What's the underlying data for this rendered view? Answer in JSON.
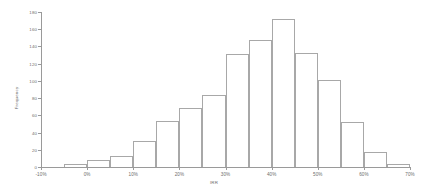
{
  "chart_data": {
    "type": "bar",
    "title": "",
    "xlabel": "IRR",
    "ylabel": "Frequency",
    "xlim": [
      -10,
      70
    ],
    "ylim": [
      0,
      180
    ],
    "grid": false,
    "legend": null,
    "bin_width": 5,
    "x_tick_labels": [
      "-10%",
      "0%",
      "10%",
      "20%",
      "30%",
      "40%",
      "50%",
      "60%",
      "70%"
    ],
    "x_tick_values": [
      -10,
      0,
      10,
      20,
      30,
      40,
      50,
      60,
      70
    ],
    "y_tick_labels": [
      "0",
      "20",
      "40",
      "60",
      "80",
      "100",
      "120",
      "140",
      "160",
      "180"
    ],
    "y_tick_values": [
      0,
      20,
      40,
      60,
      80,
      100,
      120,
      140,
      160,
      180
    ],
    "bins": [
      {
        "start": -5,
        "end": 0,
        "value": 3
      },
      {
        "start": 0,
        "end": 5,
        "value": 8
      },
      {
        "start": 5,
        "end": 10,
        "value": 13
      },
      {
        "start": 10,
        "end": 15,
        "value": 30
      },
      {
        "start": 15,
        "end": 20,
        "value": 53
      },
      {
        "start": 20,
        "end": 25,
        "value": 68
      },
      {
        "start": 25,
        "end": 30,
        "value": 84
      },
      {
        "start": 30,
        "end": 35,
        "value": 131
      },
      {
        "start": 35,
        "end": 40,
        "value": 147
      },
      {
        "start": 40,
        "end": 45,
        "value": 172
      },
      {
        "start": 45,
        "end": 50,
        "value": 132
      },
      {
        "start": 50,
        "end": 55,
        "value": 101
      },
      {
        "start": 55,
        "end": 60,
        "value": 52
      },
      {
        "start": 60,
        "end": 65,
        "value": 18
      },
      {
        "start": 65,
        "end": 70,
        "value": 3
      }
    ],
    "colors": {
      "bar_border": "#a8a8a8",
      "bar_fill": "transparent",
      "axis": "#9a9a9a",
      "text": "#6d6d6d",
      "background": "#ffffff"
    }
  }
}
